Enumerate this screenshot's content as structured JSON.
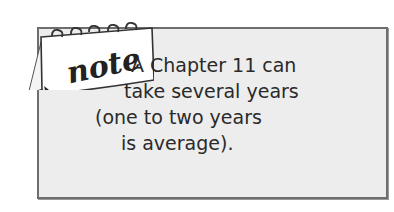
{
  "note": {
    "icon_label": "note",
    "icon": "note-calendar-icon",
    "lines": [
      "A Chapter 11 can",
      "take several years",
      "(one to two years",
      "is average)."
    ]
  },
  "colors": {
    "box_fill": "#ededed",
    "box_border": "#6e6e6e",
    "text": "#2a2a2a"
  }
}
